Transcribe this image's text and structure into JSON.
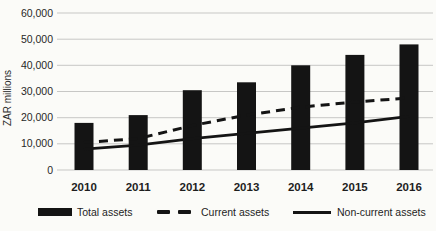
{
  "chart_data": {
    "type": "bar",
    "title": "",
    "categories": [
      "2010",
      "2011",
      "2012",
      "2013",
      "2014",
      "2015",
      "2016"
    ],
    "series": [
      {
        "name": "Total assets",
        "style": "bar",
        "values": [
          18000,
          21000,
          30500,
          33500,
          40000,
          44000,
          48000
        ]
      },
      {
        "name": "Current assets",
        "style": "dashed-line",
        "values": [
          10500,
          12000,
          17000,
          21000,
          24000,
          26000,
          27500
        ]
      },
      {
        "name": "Non-current assets",
        "style": "solid-line",
        "values": [
          8000,
          9500,
          12000,
          14000,
          16000,
          18000,
          20500
        ]
      }
    ],
    "xlabel": "",
    "ylabel": "ZAR millions",
    "ylim": [
      0,
      60000
    ],
    "ytick_step": 10000,
    "ytick_labels": [
      "0",
      "10,000",
      "20,000",
      "30,000",
      "40,000",
      "50,000",
      "60,000"
    ],
    "grid": true,
    "legend_position": "bottom",
    "colors": {
      "bar": "#141414",
      "line": "#141414",
      "grid": "#c7c7c5",
      "text": "#272727",
      "background": "#fbfbf8"
    }
  }
}
